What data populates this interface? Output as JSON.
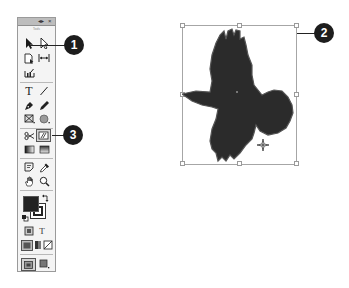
{
  "toolbox": {
    "title": "Tools",
    "header_buttons": {
      "collapse": "◂▸",
      "close": "×"
    },
    "tools": [
      {
        "name": "selection-tool",
        "row": 1,
        "col": 1
      },
      {
        "name": "direct-selection-tool",
        "row": 1,
        "col": 2
      },
      {
        "name": "page-tool",
        "row": 2,
        "col": 1
      },
      {
        "name": "gap-tool",
        "row": 2,
        "col": 2
      },
      {
        "name": "content-collector-tool",
        "row": 3,
        "col": 1
      },
      {
        "name": "type-tool",
        "row": 4,
        "col": 1,
        "glyph": "T"
      },
      {
        "name": "line-tool",
        "row": 4,
        "col": 2
      },
      {
        "name": "pen-tool",
        "row": 5,
        "col": 1
      },
      {
        "name": "pencil-tool",
        "row": 5,
        "col": 2
      },
      {
        "name": "rectangle-frame-tool",
        "row": 6,
        "col": 1
      },
      {
        "name": "ellipse-tool",
        "row": 6,
        "col": 2
      },
      {
        "name": "scissors-tool",
        "row": 7,
        "col": 1
      },
      {
        "name": "free-transform-tool",
        "row": 7,
        "col": 2,
        "selected": true
      },
      {
        "name": "gradient-swatch-tool",
        "row": 8,
        "col": 1
      },
      {
        "name": "gradient-feather-tool",
        "row": 8,
        "col": 2
      },
      {
        "name": "note-tool",
        "row": 9,
        "col": 1
      },
      {
        "name": "eyedropper-tool",
        "row": 9,
        "col": 2
      },
      {
        "name": "hand-tool",
        "row": 10,
        "col": 1
      },
      {
        "name": "zoom-tool",
        "row": 10,
        "col": 2
      }
    ],
    "fill_stroke": {
      "fill_color": "#222222",
      "stroke_color": "#222222"
    },
    "format_row": {
      "text_glyph": "T"
    },
    "view_row": [
      "apply-color",
      "apply-gradient",
      "apply-none"
    ],
    "screen_mode": [
      "normal-mode",
      "preview-mode"
    ]
  },
  "canvas": {
    "object": "bird-silhouette",
    "fill_color": "#2b2b2b",
    "selection": {
      "x": 182,
      "y": 25,
      "width": 115,
      "height": 140
    }
  },
  "callouts": [
    {
      "label": "1",
      "target": "selection-tool"
    },
    {
      "label": "2",
      "target": "selected-object-bounding-box"
    },
    {
      "label": "3",
      "target": "free-transform-tool"
    }
  ]
}
